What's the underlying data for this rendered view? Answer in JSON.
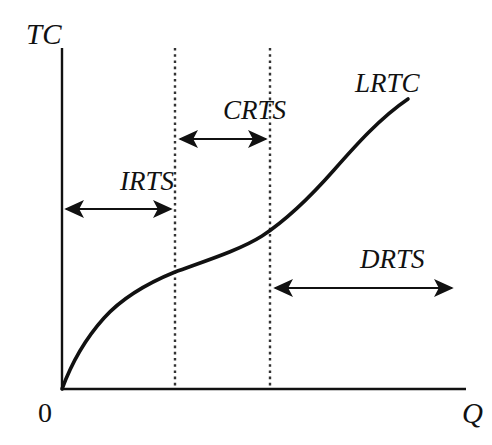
{
  "figure": {
    "background_color": "#ffffff",
    "ink_color": "#111111"
  },
  "axes": {
    "y_label": "TC",
    "x_label": "Q",
    "origin_label": "0",
    "y_axis": {
      "x": 62,
      "y_top": 48,
      "y_bottom": 389
    },
    "x_axis": {
      "y": 389,
      "x_left": 62,
      "x_right": 466
    }
  },
  "curve": {
    "label": "LRTC",
    "stroke_width": 3.6,
    "points": [
      [
        62,
        389
      ],
      [
        70,
        368
      ],
      [
        79,
        350
      ],
      [
        89,
        334
      ],
      [
        100,
        319
      ],
      [
        113,
        305
      ],
      [
        128,
        293
      ],
      [
        145,
        283
      ],
      [
        163,
        276
      ],
      [
        175,
        272
      ],
      [
        192,
        266
      ],
      [
        210,
        260
      ],
      [
        228,
        253
      ],
      [
        246,
        245
      ],
      [
        262,
        236
      ],
      [
        270,
        231
      ],
      [
        285,
        221
      ],
      [
        300,
        209
      ],
      [
        315,
        195
      ],
      [
        329,
        180
      ],
      [
        342,
        165
      ],
      [
        354,
        150
      ],
      [
        365,
        136
      ],
      [
        375,
        124
      ],
      [
        385,
        114
      ],
      [
        395,
        106
      ],
      [
        403,
        101
      ],
      [
        408,
        99
      ]
    ]
  },
  "dividers": [
    {
      "name": "irts-crts-boundary",
      "x": 175,
      "y_top": 48,
      "y_bottom": 389
    },
    {
      "name": "crts-drts-boundary",
      "x": 270,
      "y_top": 48,
      "y_bottom": 389
    }
  ],
  "regions": [
    {
      "id": "irts",
      "label": "IRTS",
      "label_x": 120,
      "label_y": 190,
      "arrow": {
        "x_start": 63,
        "x_end": 174,
        "y": 209
      }
    },
    {
      "id": "crts",
      "label": "CRTS",
      "label_x": 223,
      "label_y": 119,
      "arrow": {
        "x_start": 176,
        "x_end": 269,
        "y": 139
      }
    },
    {
      "id": "drts",
      "label": "DRTS",
      "label_x": 360,
      "label_y": 268,
      "arrow": {
        "x_start": 271,
        "x_end": 456,
        "y": 288
      }
    }
  ],
  "labels": {
    "y_axis_label_x": 26,
    "y_axis_label_y": 44,
    "x_axis_label_x": 462,
    "x_axis_label_y": 423,
    "origin_x": 38,
    "origin_y": 422,
    "curve_label_x": 355,
    "curve_label_y": 92
  }
}
